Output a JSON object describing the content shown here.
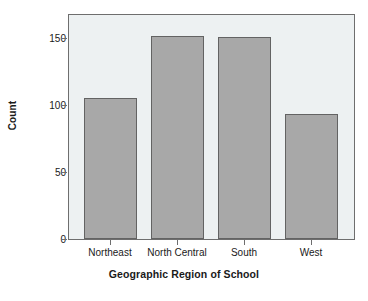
{
  "chart_data": {
    "type": "bar",
    "title": "",
    "subtitle": "",
    "xlabel": "Geographic Region of School",
    "ylabel": "Count",
    "categories": [
      "Northeast",
      "North Central",
      "South",
      "West"
    ],
    "values": [
      105,
      151,
      150,
      93
    ],
    "series": [
      {
        "name": "Count",
        "values": [
          105,
          151,
          150,
          93
        ]
      }
    ],
    "ylim": [
      0,
      168
    ],
    "yticks": [
      0,
      50,
      100,
      150
    ],
    "ytick_labels": [
      "0",
      "50",
      "100",
      "150"
    ],
    "grid": false,
    "legend": false,
    "legend_position": "none",
    "bar_fill_color": "#a8a8a8",
    "bar_edge_color": "#636363",
    "plot_background_color": "#edf1f2",
    "axis_color": "#6e6e6e",
    "text_color": "#1a1a1a",
    "figure_background_color": "#ffffff"
  }
}
